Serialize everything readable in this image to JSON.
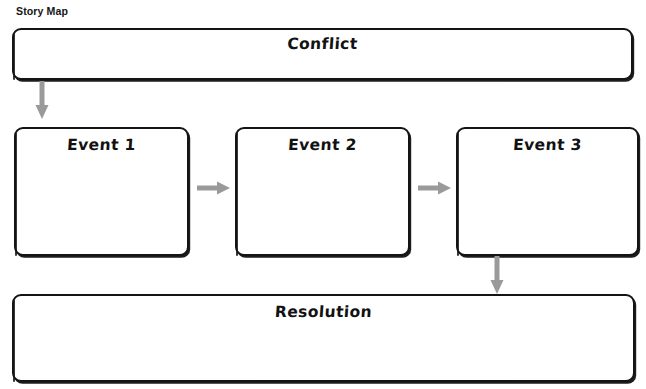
{
  "page": {
    "title": "Story Map",
    "background_color": "#ffffff",
    "stroke_color": "#141414",
    "arrow_color": "#9a9a9a",
    "top_remnant_text": "·  ·   ·"
  },
  "nodes": {
    "conflict": {
      "label": "Conflict",
      "shape": "rounded-rectangle"
    },
    "event_1": {
      "label": "Event 1",
      "shape": "rounded-rectangle"
    },
    "event_2": {
      "label": "Event 2",
      "shape": "rounded-rectangle"
    },
    "event_3": {
      "label": "Event 3",
      "shape": "rounded-rectangle"
    },
    "resolution": {
      "label": "Resolution",
      "shape": "rounded-rectangle"
    }
  },
  "connectors": [
    {
      "name": "conflict-to-event-1",
      "from": "conflict",
      "to": "event_1",
      "direction": "down"
    },
    {
      "name": "event-1-to-event-2",
      "from": "event_1",
      "to": "event_2",
      "direction": "right"
    },
    {
      "name": "event-2-to-event-3",
      "from": "event_2",
      "to": "event_3",
      "direction": "right"
    },
    {
      "name": "event-3-to-resolution",
      "from": "event_3",
      "to": "resolution",
      "direction": "down"
    }
  ]
}
